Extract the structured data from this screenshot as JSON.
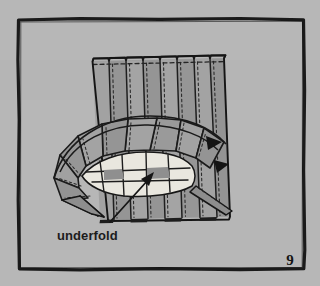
{
  "figure": {
    "page_number": "9",
    "caption": "underfold",
    "colors": {
      "background": "#b2b2b2",
      "frame_line": "#1a1a1a",
      "fabric_fill": "#9a9a9a",
      "fabric_fill_light": "#a6a6a6",
      "fabric_fill_dark": "#8c8c8c",
      "underfold_highlight": "#e8e6de",
      "ink": "#1c1c1c",
      "stitch_dash": "#2a2a2a"
    },
    "frame": {
      "x": 17,
      "y": 18,
      "width": 288,
      "height": 252,
      "stroke_width": 3
    },
    "parts": [
      {
        "name": "pleated-panel",
        "label": "Vertical knife pleats of skirt body"
      },
      {
        "name": "waist-dashed-line",
        "label": "Horizontal stitching line at top"
      },
      {
        "name": "fan-pleats",
        "label": "Radially fanned pleats"
      },
      {
        "name": "underfold-highlight",
        "label": "Exposed underfold area"
      },
      {
        "name": "underfold-arrow",
        "label": "Leader arrow to underfold"
      }
    ],
    "pleat_count": 8,
    "fan_segment_count": 9
  }
}
